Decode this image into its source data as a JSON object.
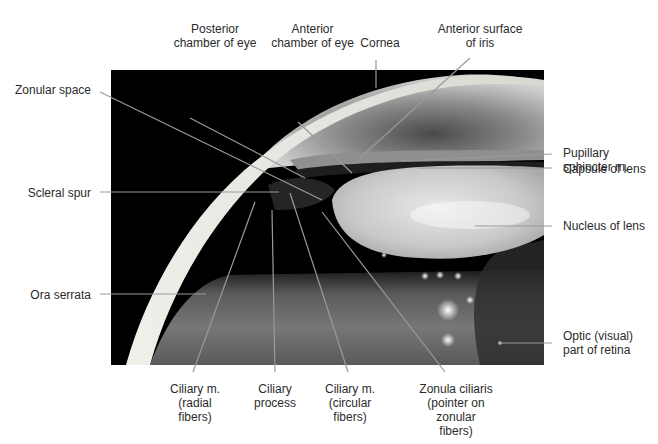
{
  "figure": {
    "type": "anatomical photograph with leader-line labels",
    "colors": {
      "background": "#ffffff",
      "photo_background": "#000000",
      "leader_line": "#9a9a9a",
      "label_text": "#2b2b2b"
    }
  },
  "labels": {
    "top": [
      {
        "id": "posterior-chamber",
        "line1": "Posterior",
        "line2": "chamber of eye"
      },
      {
        "id": "anterior-chamber",
        "line1": "Anterior",
        "line2": "chamber of eye"
      },
      {
        "id": "cornea",
        "line1": "Cornea"
      },
      {
        "id": "anterior-surface-iris",
        "line1": "Anterior surface",
        "line2": "of iris"
      }
    ],
    "left": [
      {
        "id": "zonular-space",
        "line1": "Zonular space"
      },
      {
        "id": "scleral-spur",
        "line1": "Scleral spur"
      },
      {
        "id": "ora-serrata",
        "line1": "Ora serrata"
      }
    ],
    "right": [
      {
        "id": "pupillary-sphincter",
        "line1": "Pupillary",
        "line2": "sphincter m."
      },
      {
        "id": "capsule-lens",
        "line1": "Capsule of lens"
      },
      {
        "id": "nucleus-lens",
        "line1": "Nucleus of lens"
      },
      {
        "id": "optic-retina",
        "line1": "Optic (visual)",
        "line2": "part of retina"
      }
    ],
    "bottom": [
      {
        "id": "ciliary-radial",
        "line1": "Ciliary m.",
        "line2": "(radial",
        "line3": "fibers)"
      },
      {
        "id": "ciliary-process",
        "line1": "Ciliary",
        "line2": "process"
      },
      {
        "id": "ciliary-circular",
        "line1": "Ciliary m.",
        "line2": "(circular",
        "line3": "fibers)"
      },
      {
        "id": "zonula-ciliaris",
        "line1": "Zonula ciliaris",
        "line2": "(pointer on",
        "line3": "zonular",
        "line4": "fibers)"
      }
    ]
  }
}
